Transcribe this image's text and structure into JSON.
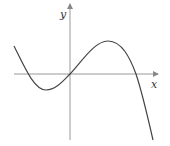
{
  "diagram": {
    "type": "function-graph",
    "axes": {
      "x_label": "x",
      "y_label": "y"
    },
    "colors": {
      "axis": "#888888",
      "curve": "#444444"
    }
  }
}
